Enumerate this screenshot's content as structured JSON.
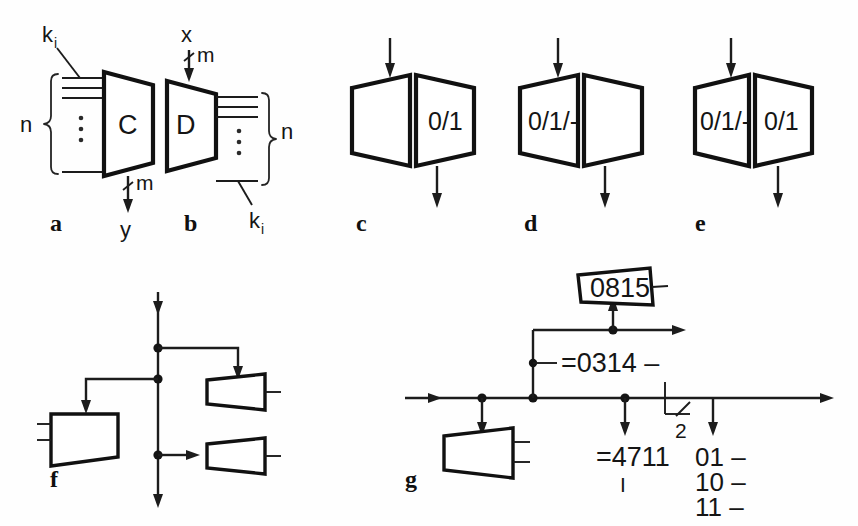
{
  "figure": {
    "caption_letters": [
      "a",
      "b",
      "c",
      "d",
      "e",
      "f",
      "g"
    ],
    "ink_color": "#1c1c1c",
    "background_color": "#fefefe"
  },
  "panels": {
    "a": {
      "letter": "a",
      "block_label": "C",
      "input_bundle_label": "k",
      "input_bundle_subscript": "i",
      "bundle_count_label": "n",
      "output_width_label": "m",
      "output_signal_label": "y",
      "ellipsis": "⋮"
    },
    "b": {
      "letter": "b",
      "block_label": "D",
      "input_signal_label": "x",
      "input_width_label": "m",
      "output_bundle_label": "k",
      "output_bundle_subscript": "i",
      "bundle_count_label": "n",
      "ellipsis": "⋮"
    },
    "c": {
      "letter": "c",
      "left_label": "",
      "right_label": "0/1"
    },
    "d": {
      "letter": "d",
      "left_label": "0/1/-",
      "right_label": ""
    },
    "e": {
      "letter": "e",
      "left_label": "0/1/-",
      "right_label": "0/1"
    },
    "f": {
      "letter": "f"
    },
    "g": {
      "letter": "g",
      "top_block_label": "0815",
      "bus_label_mid": "=0314 –",
      "bus_label_lower": "=4711",
      "bus_label_lower_mark": "I",
      "bit_width_label": "2",
      "decode_labels": [
        "01 –",
        "10 –",
        "11 –"
      ]
    }
  }
}
